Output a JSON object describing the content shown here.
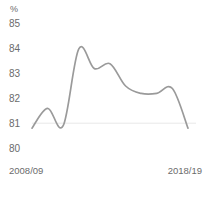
{
  "chart_data": {
    "type": "line",
    "title": "",
    "subtitle": "",
    "xlabel": "",
    "ylabel": "%",
    "unit_label": "%",
    "ylim": [
      80,
      85
    ],
    "yticks": [
      85,
      84,
      83,
      82,
      81,
      80
    ],
    "ytick_labels": [
      "85",
      "84",
      "83",
      "82",
      "81",
      "80"
    ],
    "grid": "baseline-only",
    "gridline_value": 81,
    "legend": "none",
    "x_axis_labels": [
      "2008/09",
      "2018/19"
    ],
    "categories": [
      "2008/09",
      "2009/10",
      "2010/11",
      "2011/12",
      "2012/13",
      "2013/14",
      "2014/15",
      "2015/16",
      "2016/17",
      "2017/18",
      "2018/19"
    ],
    "series": [
      {
        "name": "percentage",
        "color": "#9a9a9a",
        "values": [
          80.8,
          81.6,
          80.9,
          84.0,
          83.2,
          83.4,
          82.5,
          82.2,
          82.2,
          82.4,
          80.8
        ]
      }
    ]
  },
  "axis": {
    "unit": "%",
    "y_labels": [
      "85",
      "84",
      "83",
      "82",
      "81",
      "80"
    ],
    "x_start": "2008/09",
    "x_end": "2018/19"
  },
  "colors": {
    "line": "#9a9a9a",
    "text": "#6b6b6b",
    "gridline": "#e8e8e8",
    "background": "#ffffff"
  }
}
